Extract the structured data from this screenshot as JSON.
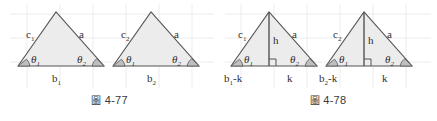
{
  "figures": [
    {
      "id": "4-77",
      "caption_mark": "圖",
      "caption_number": "4-77",
      "caption_full": "圖 4-77",
      "triangles": [
        {
          "name": "triangle-1",
          "side_left": "c",
          "side_left_sub": "1",
          "side_right": "a",
          "side_right_sub": "",
          "base": "b",
          "base_sub": "1",
          "angle_left": "θ",
          "angle_left_sub": "1",
          "angle_right": "θ",
          "angle_right_sub": "2"
        },
        {
          "name": "triangle-2",
          "side_left": "c",
          "side_left_sub": "2",
          "side_right": "a",
          "side_right_sub": "",
          "base": "b",
          "base_sub": "2",
          "angle_left": "θ",
          "angle_left_sub": "1",
          "angle_right": "θ",
          "angle_right_sub": "2"
        }
      ]
    },
    {
      "id": "4-78",
      "caption_mark": "圖",
      "caption_number": "4-78",
      "caption_full": "圖 4-78",
      "triangles": [
        {
          "name": "triangle-3",
          "side_left": "c",
          "side_left_sub": "1",
          "side_right": "a",
          "side_right_sub": "",
          "height": "h",
          "base_left": "b",
          "base_left_sub": "1",
          "base_left_suffix": "-k",
          "base_right": "k",
          "angle_left": "θ",
          "angle_left_sub": "1",
          "angle_right": "θ",
          "angle_right_sub": "2"
        },
        {
          "name": "triangle-4",
          "side_left": "c",
          "side_left_sub": "2",
          "side_right": "a",
          "side_right_sub": "",
          "height": "h",
          "base_left": "b",
          "base_left_sub": "2",
          "base_left_suffix": "-k",
          "base_right": "k",
          "angle_left": "θ",
          "angle_left_sub": "1",
          "angle_right": "θ",
          "angle_right_sub": "2"
        }
      ]
    }
  ],
  "colors": {
    "stroke": "#555555",
    "fill": "#ececec",
    "angle_fill": "#bfbfbf",
    "grid": "#e8e8e8",
    "text": "#2e2e2e",
    "background": "#ffffff"
  }
}
